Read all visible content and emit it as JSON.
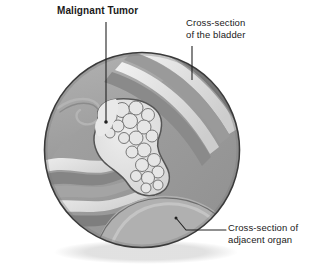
{
  "figure": {
    "title_label": "Malignant Tumor",
    "bladder_label": "Cross-section\nof the bladder",
    "organ_label": "Cross-section of\nadjacent organ",
    "colors": {
      "background": "#ffffff",
      "text": "#1a1a1a",
      "leader_line": "#222222",
      "circle_outline": "#3a3a3a",
      "tissue_mid": "#9c9c9c",
      "tissue_dark": "#7e7e7e",
      "tissue_darker": "#6b6b6b",
      "tissue_light": "#c9c9c9",
      "tissue_lighter": "#dedede",
      "tissue_highlight": "#efefef",
      "tumor_fill": "#e2e2e2",
      "tumor_outline": "#565656",
      "shadow": "#e8e8e8"
    },
    "geometry": {
      "circle_center_x": 142,
      "circle_center_y": 150,
      "circle_radius": 98
    }
  }
}
